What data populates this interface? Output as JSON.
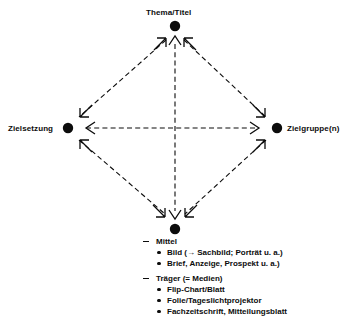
{
  "diagram": {
    "type": "relationship-diamond",
    "nodes": [
      {
        "id": "thema",
        "label": "Thema/Titel",
        "position": "top",
        "cx": 175,
        "cy": 26,
        "r": 5
      },
      {
        "id": "zielsetzung",
        "label": "Zielsetzung",
        "position": "left",
        "cx": 68,
        "cy": 128,
        "r": 5
      },
      {
        "id": "zielgruppe",
        "label": "Zielgruppe(n)",
        "position": "right",
        "cx": 277,
        "cy": 128,
        "r": 5
      },
      {
        "id": "mittel",
        "label": "",
        "position": "bottom",
        "cx": 175,
        "cy": 229,
        "r": 5
      }
    ],
    "edges": [
      {
        "from": "thema",
        "to": "zielsetzung",
        "style": "dashed",
        "arrows": "both"
      },
      {
        "from": "thema",
        "to": "zielgruppe",
        "style": "dashed",
        "arrows": "both"
      },
      {
        "from": "zielsetzung",
        "to": "mittel",
        "style": "dashed",
        "arrows": "both"
      },
      {
        "from": "zielgruppe",
        "to": "mittel",
        "style": "dashed",
        "arrows": "both"
      },
      {
        "from": "zielsetzung",
        "to": "zielgruppe",
        "style": "dashed",
        "arrows": "both"
      },
      {
        "from": "thema",
        "to": "mittel",
        "style": "dashed",
        "arrows": "both"
      }
    ],
    "line_color": "#0c0c0c",
    "node_color": "#0c0c0c"
  },
  "legend": {
    "groups": [
      {
        "heading": "Mittel",
        "items": [
          "Bild (→ Sachbild; Porträt u. a.)",
          "Brief, Anzeige, Prospekt u. a.)"
        ]
      },
      {
        "heading": "Träger (= Medien)",
        "items": [
          "Flip-Chart/Blatt",
          "Folie/Tageslichtprojektor",
          "Fachzeitschrift, Mitteilungsblatt"
        ]
      }
    ]
  }
}
